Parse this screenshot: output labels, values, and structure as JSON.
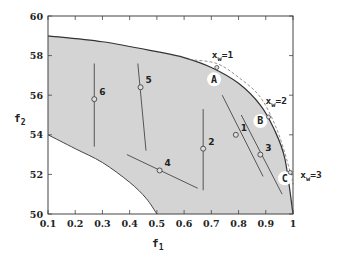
{
  "chart_data": {
    "type": "scatter",
    "title": "",
    "xlabel": "f1",
    "ylabel": "f2",
    "xlim": [
      0.1,
      1.0
    ],
    "ylim": [
      50,
      60
    ],
    "x_ticks": [
      "0.1",
      "0.2",
      "0.3",
      "0.4",
      "0.5",
      "0.6",
      "0.7",
      "0.8",
      "0.9",
      "1"
    ],
    "y_ticks": [
      "50",
      "52",
      "54",
      "56",
      "58",
      "60"
    ],
    "grid": false,
    "feasible_region": {
      "fill": "#d4d4d4",
      "upper_boundary": [
        [
          0.1,
          59.0
        ],
        [
          0.3,
          58.7
        ],
        [
          0.5,
          58.2
        ],
        [
          0.6,
          57.9
        ],
        [
          0.7,
          57.4
        ],
        [
          0.8,
          56.6
        ],
        [
          0.88,
          55.5
        ],
        [
          0.93,
          54.3
        ],
        [
          0.97,
          52.8
        ],
        [
          1.0,
          50.0
        ]
      ],
      "lower_boundary": [
        [
          0.1,
          54.0
        ],
        [
          0.2,
          53.3
        ],
        [
          0.3,
          52.6
        ],
        [
          0.4,
          51.6
        ],
        [
          0.46,
          50.8
        ],
        [
          0.5,
          50.0
        ]
      ]
    },
    "points": [
      {
        "id": "1",
        "f1": 0.79,
        "f2": 54.0,
        "segment": [
          [
            0.74,
            56.0
          ],
          [
            0.89,
            51.9
          ]
        ]
      },
      {
        "id": "2",
        "f1": 0.67,
        "f2": 53.3,
        "segment": [
          [
            0.67,
            55.3
          ],
          [
            0.67,
            51.2
          ]
        ]
      },
      {
        "id": "3",
        "f1": 0.88,
        "f2": 53.0,
        "segment": [
          [
            0.81,
            55.0
          ],
          [
            0.96,
            51.0
          ]
        ]
      },
      {
        "id": "4",
        "f1": 0.51,
        "f2": 52.2,
        "segment": [
          [
            0.39,
            53.0
          ],
          [
            0.65,
            51.3
          ]
        ]
      },
      {
        "id": "5",
        "f1": 0.44,
        "f2": 56.4,
        "segment": [
          [
            0.43,
            57.6
          ],
          [
            0.46,
            53.2
          ]
        ]
      },
      {
        "id": "6",
        "f1": 0.27,
        "f2": 55.8,
        "segment": [
          [
            0.27,
            57.6
          ],
          [
            0.27,
            53.4
          ]
        ]
      }
    ],
    "annotations": [
      {
        "label": "x_w=1",
        "f1": 0.72,
        "f2": 57.4
      },
      {
        "label": "x_w=2",
        "f1": 0.91,
        "f2": 54.9
      },
      {
        "label": "x_w=3",
        "f1": 0.99,
        "f2": 52.1
      }
    ],
    "regions": [
      {
        "label": "A",
        "f1": 0.71,
        "f2": 56.8
      },
      {
        "label": "B",
        "f1": 0.88,
        "f2": 54.7
      },
      {
        "label": "C",
        "f1": 0.97,
        "f2": 51.8
      }
    ],
    "dashed_curve": [
      [
        0.62,
        57.8
      ],
      [
        0.72,
        57.6
      ],
      [
        0.8,
        56.9
      ],
      [
        0.88,
        55.9
      ],
      [
        0.94,
        54.3
      ],
      [
        0.98,
        52.6
      ],
      [
        1.0,
        51.5
      ]
    ]
  },
  "labels": {
    "xlabel_main": "f",
    "xlabel_sub": "1",
    "ylabel_main": "f",
    "ylabel_sub": "2",
    "xw_main": "x",
    "xw_sub": "w",
    "xw1_val": "=1",
    "xw2_val": "=2",
    "xw3_val": "=3"
  }
}
